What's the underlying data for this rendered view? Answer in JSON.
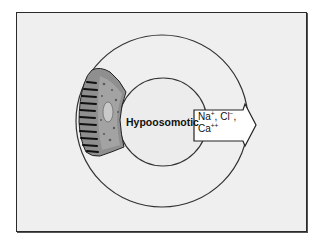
{
  "diagram": {
    "center_label": "Hypoosomotic",
    "arrow_label": {
      "line1": "Na+, Cl−,",
      "line2": "Ca++",
      "ions": [
        {
          "symbol": "Na",
          "charge": "+"
        },
        {
          "symbol": "Cl",
          "charge": "−"
        },
        {
          "symbol": "Ca",
          "charge": "++"
        }
      ]
    },
    "colors": {
      "background": "#efefef",
      "frame_border": "#2a2a2a",
      "circle_stroke": "#333333",
      "cell_fill": "#8a8a8a",
      "arrow_fill": "#ffffff"
    }
  }
}
